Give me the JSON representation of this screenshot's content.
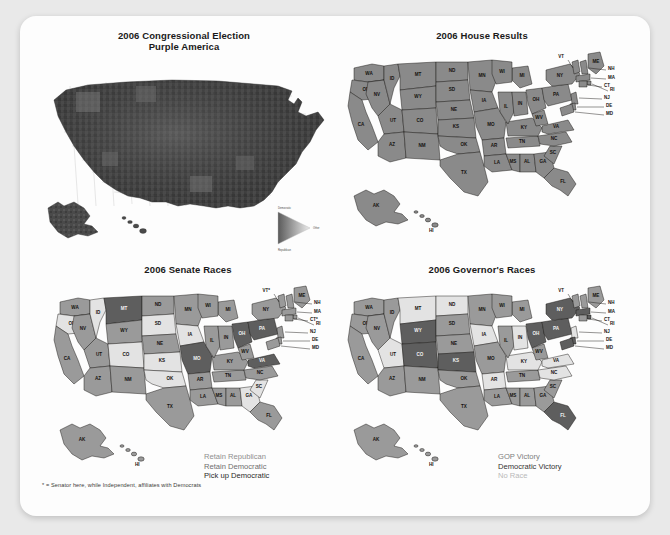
{
  "page": {
    "background_color": "#e9e9e9",
    "card_color": "#fdfdfd"
  },
  "panels": [
    {
      "id": "purple-america",
      "title_line1": "2006 Congressional Election",
      "title_line2": "Purple America",
      "legend_triangle": {
        "top_label": "Democratic",
        "bottom_label": "Republican",
        "right_label": "Other"
      }
    },
    {
      "id": "house-results",
      "title_line1": "2006 House Results",
      "title_line2": ""
    },
    {
      "id": "senate-races",
      "title_line1": "2006 Senate Races",
      "title_line2": "",
      "legend": [
        {
          "label": "Retain Republican",
          "color": "#8f8f8f"
        },
        {
          "label": "Retain Democratic",
          "color": "#6e6e6e"
        },
        {
          "label": "Pick up Democratic",
          "color": "#2a2a2a"
        }
      ]
    },
    {
      "id": "governors-races",
      "title_line1": "2006 Governor's Races",
      "title_line2": "",
      "legend": [
        {
          "label": "GOP Victory",
          "color": "#7d7d7d"
        },
        {
          "label": "Democratic Victory",
          "color": "#333333"
        },
        {
          "label": "No Race",
          "color": "#b9b9b9"
        }
      ]
    }
  ],
  "footnote": "* = Senator here, while Independent, affiliates with Democrats",
  "state_labels": {
    "inland": [
      "WA",
      "OR",
      "ID",
      "MT",
      "ND",
      "SD",
      "WY",
      "NE",
      "NV",
      "UT",
      "CO",
      "KS",
      "CA",
      "AZ",
      "NM",
      "OK",
      "TX",
      "MN",
      "IA",
      "MO",
      "AR",
      "LA",
      "MS",
      "AL",
      "GA",
      "FL",
      "TN",
      "KY",
      "IL",
      "IN",
      "OH",
      "MI",
      "WI",
      "SC",
      "NC",
      "VA",
      "WV",
      "PA",
      "NY"
    ],
    "coastal_leader": [
      "VT",
      "ME",
      "NH",
      "MA",
      "CT",
      "RI",
      "NJ",
      "DE",
      "MD"
    ],
    "insets": [
      "AK",
      "HI"
    ],
    "senate_coastal_leader": [
      "VT*",
      "ME",
      "NH",
      "MA",
      "RI",
      "CT*",
      "NJ",
      "DE",
      "MD"
    ]
  },
  "shades": {
    "house_uniform": "#8a8a8a",
    "dark": "#5e5e5e",
    "mid": "#9a9a9a",
    "light": "#e3e3e3",
    "purple_base": "#454545"
  },
  "senate_state_shades": {
    "WA": "mid",
    "OR": "light",
    "CA": "mid",
    "NV": "mid",
    "ID": "light",
    "MT": "dark",
    "WY": "mid",
    "UT": "mid",
    "CO": "light",
    "AZ": "mid",
    "NM": "mid",
    "ND": "mid",
    "SD": "light",
    "NE": "mid",
    "KS": "light",
    "OK": "light",
    "TX": "mid",
    "MN": "mid",
    "IA": "light",
    "MO": "dark",
    "AR": "mid",
    "LA": "mid",
    "MS": "mid",
    "AL": "mid",
    "GA": "light",
    "FL": "mid",
    "TN": "mid",
    "KY": "mid",
    "IL": "mid",
    "IN": "mid",
    "OH": "dark",
    "MI": "mid",
    "WI": "mid",
    "SC": "light",
    "NC": "mid",
    "VA": "dark",
    "WV": "mid",
    "PA": "dark",
    "NY": "mid",
    "ME": "mid",
    "VT": "mid",
    "NH": "mid",
    "MA": "mid",
    "RI": "mid",
    "CT": "mid",
    "NJ": "mid",
    "DE": "mid",
    "MD": "mid",
    "AK": "mid",
    "HI": "mid"
  },
  "governor_state_shades": {
    "WA": "mid",
    "OR": "mid",
    "CA": "mid",
    "NV": "mid",
    "ID": "mid",
    "MT": "light",
    "WY": "dark",
    "UT": "light",
    "CO": "dark",
    "AZ": "mid",
    "NM": "mid",
    "ND": "light",
    "SD": "mid",
    "NE": "mid",
    "KS": "dark",
    "OK": "mid",
    "TX": "mid",
    "MN": "mid",
    "IA": "light",
    "MO": "mid",
    "AR": "light",
    "LA": "mid",
    "MS": "mid",
    "AL": "mid",
    "GA": "mid",
    "FL": "dark",
    "TN": "mid",
    "KY": "light",
    "IL": "mid",
    "IN": "light",
    "OH": "dark",
    "MI": "mid",
    "WI": "mid",
    "SC": "mid",
    "NC": "light",
    "VA": "light",
    "WV": "mid",
    "PA": "dark",
    "NY": "dark",
    "ME": "mid",
    "VT": "mid",
    "NH": "mid",
    "MA": "dark",
    "RI": "dark",
    "CT": "mid",
    "NJ": "light",
    "DE": "dark",
    "MD": "dark",
    "AK": "mid",
    "HI": "mid"
  }
}
